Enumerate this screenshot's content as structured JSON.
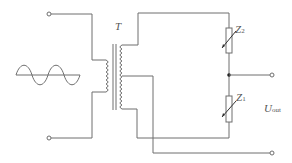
{
  "diagram": {
    "type": "circuit",
    "labels": {
      "transformer": "T",
      "z2_main": "Z",
      "z2_sub": "2",
      "z1_main": "Z",
      "z1_sub": "1",
      "uout_main": "U",
      "uout_sub": "out"
    },
    "components": [
      {
        "id": "ac-source",
        "symbol": "sine-wave"
      },
      {
        "id": "transformer",
        "label": "T",
        "windings": [
          "primary",
          "secondary-center-tapped"
        ]
      },
      {
        "id": "Z2",
        "symbol": "variable-resistor"
      },
      {
        "id": "Z1",
        "symbol": "variable-resistor"
      }
    ],
    "terminals": [
      "input-top",
      "input-bottom",
      "output-top",
      "output-bottom"
    ],
    "colors": {
      "wire": "#6e6e6e",
      "background": "#ffffff"
    }
  }
}
